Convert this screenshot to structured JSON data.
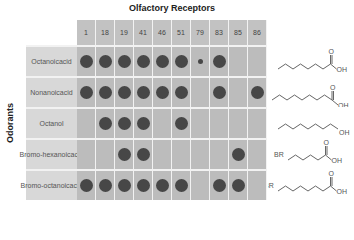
{
  "title": "Olfactory Receptors",
  "y_axis_label": "Odorants",
  "receptors": [
    "1",
    "18",
    "19",
    "41",
    "46",
    "51",
    "79",
    "83",
    "85",
    "86"
  ],
  "odorants": [
    {
      "name": "Octanoic acid",
      "label_lines": [
        "Octanoic",
        "acid"
      ],
      "responses": [
        2,
        2,
        2,
        2,
        2,
        2,
        1,
        2,
        0,
        0
      ],
      "structure": "octanoic-acid"
    },
    {
      "name": "Nonanoic acid",
      "label_lines": [
        "Nonanoic",
        "acid"
      ],
      "responses": [
        2,
        2,
        2,
        2,
        2,
        2,
        0,
        2,
        0,
        2
      ],
      "structure": "nonanoic-acid"
    },
    {
      "name": "Octanol",
      "label_lines": [
        "Octanol"
      ],
      "responses": [
        0,
        2,
        2,
        2,
        0,
        2,
        0,
        0,
        0,
        0
      ],
      "structure": "octanol"
    },
    {
      "name": "Bromohexanoic acid",
      "label_lines": [
        "Bromo-",
        "hexanoic",
        "acid"
      ],
      "responses": [
        0,
        0,
        2,
        2,
        0,
        0,
        0,
        0,
        2,
        0
      ],
      "structure": "bromohexanoic-acid"
    },
    {
      "name": "Bromooctanoic acid",
      "label_lines": [
        "Bromo-",
        "octanoic",
        "acid"
      ],
      "responses": [
        2,
        2,
        2,
        2,
        2,
        2,
        0,
        2,
        2,
        0
      ],
      "structure": "bromooctanoic-acid"
    }
  ],
  "legend": {
    "large_dot": "strong response",
    "small_dot": "weak response",
    "empty": "no response"
  },
  "structure_labels": {
    "oh": "OH",
    "o": "O",
    "br": "BR"
  },
  "colors": {
    "dot": "#474747",
    "data_cell": "#bcbcbc",
    "label_cell": "#d8d8d8",
    "header_cell": "#c2c2c2",
    "grid_line": "#f2f2f2"
  }
}
